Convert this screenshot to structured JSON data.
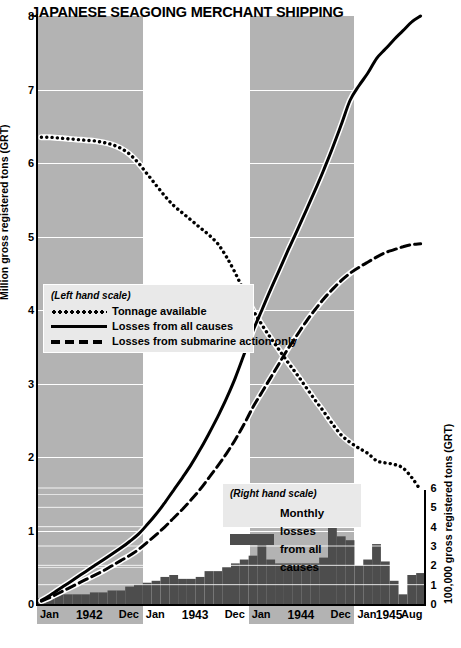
{
  "title": "JAPANESE SEAGOING MERCHANT SHIPPING",
  "axes": {
    "left": {
      "title": "Million gross registered tons (GRT)",
      "ticks": [
        "0",
        "1",
        "2",
        "3",
        "4",
        "5",
        "6",
        "7",
        "8"
      ],
      "min": 0,
      "max": 8
    },
    "right": {
      "title": "100,000 gross registered tons (GRT)",
      "ticks": [
        "0",
        "1",
        "2",
        "3",
        "4",
        "5",
        "6"
      ],
      "min": 0,
      "max": 6
    },
    "bottom": {
      "start_label": "Jan",
      "end_label": "Aug",
      "year_groups": [
        {
          "year": "1942",
          "start": "Jan",
          "end": "Dec"
        },
        {
          "year": "1943",
          "start": "Jan",
          "end": "Dec"
        },
        {
          "year": "1944",
          "start": "Jan",
          "end": "Dec"
        },
        {
          "year": "1945",
          "start": "Jan",
          "end": "Aug"
        }
      ]
    }
  },
  "legend_left": {
    "header": "(Left hand scale)",
    "items": [
      {
        "style": "dotted",
        "label": "Tonnage available"
      },
      {
        "style": "solid",
        "label": "Losses from all causes"
      },
      {
        "style": "dashed",
        "label": "Losses from submarine action only"
      }
    ]
  },
  "legend_right": {
    "header": "(Right hand scale)",
    "label_line1": "Monthly losses",
    "label_line2": "from all causes",
    "swatch_color": "#4d4d4d"
  },
  "colors": {
    "band": "#b3b3b3",
    "bar": "#4d4d4d",
    "line": "#000000",
    "grid": "#ffffff",
    "background": "#ffffff"
  },
  "chart_data": {
    "type": "line",
    "title": "JAPANESE SEAGOING MERCHANT SHIPPING",
    "xlabel": "",
    "ylabel": "Million gross registered tons (GRT)",
    "y2label": "100,000 gross registered tons (GRT)",
    "ylim": [
      0,
      8
    ],
    "y2lim": [
      0,
      6
    ],
    "grid": true,
    "legend_position": "inside-left, inside-bottom-right",
    "x": [
      "1942-01",
      "1942-02",
      "1942-03",
      "1942-04",
      "1942-05",
      "1942-06",
      "1942-07",
      "1942-08",
      "1942-09",
      "1942-10",
      "1942-11",
      "1942-12",
      "1943-01",
      "1943-02",
      "1943-03",
      "1943-04",
      "1943-05",
      "1943-06",
      "1943-07",
      "1943-08",
      "1943-09",
      "1943-10",
      "1943-11",
      "1943-12",
      "1944-01",
      "1944-02",
      "1944-03",
      "1944-04",
      "1944-05",
      "1944-06",
      "1944-07",
      "1944-08",
      "1944-09",
      "1944-10",
      "1944-11",
      "1944-12",
      "1945-01",
      "1945-02",
      "1945-03",
      "1945-04",
      "1945-05",
      "1945-06",
      "1945-07",
      "1945-08"
    ],
    "series": [
      {
        "name": "Tonnage available",
        "style": "dotted",
        "axis": "left",
        "unit": "million GRT",
        "values": [
          6.35,
          6.35,
          6.34,
          6.33,
          6.32,
          6.31,
          6.3,
          6.28,
          6.25,
          6.2,
          6.12,
          6.0,
          5.85,
          5.7,
          5.55,
          5.42,
          5.32,
          5.22,
          5.12,
          5.02,
          4.9,
          4.72,
          4.5,
          4.25,
          4.0,
          3.8,
          3.62,
          3.45,
          3.28,
          3.12,
          2.95,
          2.78,
          2.62,
          2.45,
          2.3,
          2.2,
          2.12,
          2.05,
          1.95,
          1.92,
          1.9,
          1.85,
          1.72,
          1.55
        ]
      },
      {
        "name": "Losses from all causes",
        "style": "solid",
        "axis": "left",
        "unit": "million GRT (cumulative)",
        "values": [
          0.05,
          0.12,
          0.2,
          0.28,
          0.36,
          0.44,
          0.52,
          0.6,
          0.68,
          0.76,
          0.85,
          0.95,
          1.08,
          1.22,
          1.38,
          1.55,
          1.72,
          1.9,
          2.1,
          2.32,
          2.55,
          2.8,
          3.08,
          3.4,
          3.72,
          4.0,
          4.28,
          4.55,
          4.82,
          5.08,
          5.35,
          5.62,
          5.9,
          6.2,
          6.52,
          6.85,
          7.05,
          7.22,
          7.42,
          7.55,
          7.68,
          7.8,
          7.92,
          8.0
        ]
      },
      {
        "name": "Losses from submarine action only",
        "style": "dashed",
        "axis": "left",
        "unit": "million GRT (cumulative)",
        "values": [
          0.04,
          0.09,
          0.15,
          0.21,
          0.27,
          0.33,
          0.39,
          0.45,
          0.52,
          0.59,
          0.66,
          0.74,
          0.84,
          0.94,
          1.05,
          1.17,
          1.29,
          1.42,
          1.56,
          1.72,
          1.88,
          2.05,
          2.24,
          2.45,
          2.68,
          2.88,
          3.08,
          3.28,
          3.48,
          3.66,
          3.84,
          4.0,
          4.15,
          4.28,
          4.4,
          4.5,
          4.58,
          4.65,
          4.72,
          4.78,
          4.82,
          4.86,
          4.89,
          4.9
        ]
      }
    ],
    "bars": {
      "name": "Monthly losses from all causes",
      "axis": "right",
      "unit": "100,000 GRT",
      "values": [
        0.3,
        0.4,
        0.5,
        0.5,
        0.5,
        0.5,
        0.6,
        0.6,
        0.7,
        0.7,
        0.9,
        1.0,
        1.1,
        1.2,
        1.4,
        1.5,
        1.3,
        1.3,
        1.4,
        1.7,
        1.7,
        1.9,
        2.1,
        2.3,
        2.5,
        3.2,
        2.3,
        2.1,
        2.1,
        2.1,
        2.1,
        2.1,
        2.4,
        4.5,
        3.5,
        3.3,
        2.0,
        2.3,
        3.1,
        2.2,
        1.2,
        0.5,
        1.5,
        1.6
      ]
    }
  }
}
